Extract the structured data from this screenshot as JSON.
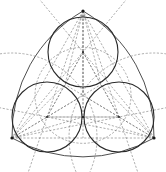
{
  "diagram": {
    "colors": {
      "line": "#2a2a2a",
      "dashed": "#6a6a6a",
      "background": "#ffffff"
    },
    "vertices": [
      {
        "name": "top",
        "x": 83,
        "y": 11
      },
      {
        "name": "bottom-left",
        "x": 12,
        "y": 138
      },
      {
        "name": "bottom-right",
        "x": 154,
        "y": 138
      }
    ],
    "circles": [
      {
        "name": "top",
        "cx": 83,
        "cy": 52,
        "r": 35
      },
      {
        "name": "bottom-left",
        "cx": 47,
        "cy": 117,
        "r": 35
      },
      {
        "name": "bottom-right",
        "cx": 119,
        "cy": 117,
        "r": 35
      }
    ],
    "reuleaux_radius": 143
  }
}
